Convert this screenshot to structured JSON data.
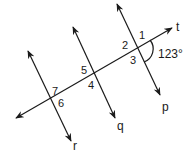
{
  "diagram": {
    "type": "parallel-lines-transversal",
    "lines": {
      "transversal": {
        "label": "t"
      },
      "parallel": [
        {
          "label": "p"
        },
        {
          "label": "q"
        },
        {
          "label": "r"
        }
      ]
    },
    "angle_labels": [
      "1",
      "2",
      "3",
      "4",
      "5",
      "6",
      "7"
    ],
    "given_angle": {
      "value": "123°",
      "between": "1 and 3"
    }
  }
}
